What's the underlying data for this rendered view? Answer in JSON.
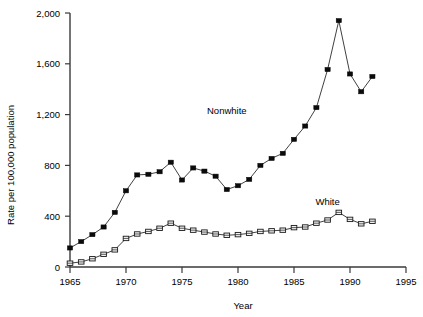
{
  "chart_data": {
    "type": "line",
    "title": "",
    "xlabel": "Year",
    "ylabel": "Rate per 100,000 population",
    "xlim": [
      1965,
      1995
    ],
    "ylim": [
      0,
      2000
    ],
    "xticks": [
      1965,
      1970,
      1975,
      1980,
      1985,
      1990,
      1995
    ],
    "xtick_labels": [
      "1965",
      "1970",
      "1975",
      "1980",
      "1985",
      "1990",
      "1995"
    ],
    "yticks": [
      0,
      400,
      800,
      1200,
      1600,
      2000
    ],
    "ytick_labels": [
      "0",
      "400",
      "800",
      "1,200",
      "1,600",
      "2,000"
    ],
    "grid": false,
    "legend_position": "inline-annotations",
    "x": [
      1965,
      1966,
      1967,
      1968,
      1969,
      1970,
      1971,
      1972,
      1973,
      1974,
      1975,
      1976,
      1977,
      1978,
      1979,
      1980,
      1981,
      1982,
      1983,
      1984,
      1985,
      1986,
      1987,
      1988,
      1989,
      1990,
      1991,
      1992
    ],
    "series": [
      {
        "name": "Nonwhite",
        "marker": "filled-square",
        "label_x": 1979,
        "label_y": 1205,
        "values": [
          150,
          200,
          255,
          315,
          430,
          600,
          725,
          730,
          750,
          825,
          685,
          780,
          755,
          715,
          610,
          640,
          690,
          800,
          855,
          895,
          1005,
          1110,
          1255,
          1555,
          1940,
          1520,
          1380,
          1500
        ]
      },
      {
        "name": "White",
        "marker": "open-square",
        "label_x": 1988,
        "label_y": 490,
        "values": [
          30,
          40,
          65,
          100,
          135,
          225,
          260,
          280,
          305,
          345,
          305,
          290,
          275,
          260,
          250,
          255,
          265,
          280,
          285,
          290,
          310,
          315,
          345,
          370,
          430,
          375,
          340,
          360
        ]
      }
    ]
  },
  "axes": {
    "y_axis_title": "Rate per 100,000 population",
    "x_axis_title": "Year"
  }
}
